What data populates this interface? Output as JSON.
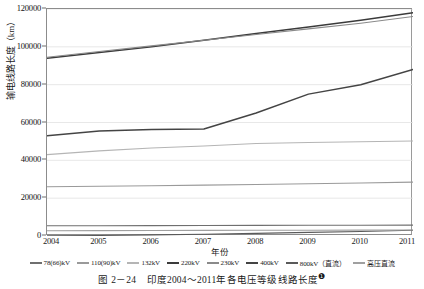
{
  "chart_data": {
    "type": "line",
    "title": "",
    "xlabel": "年份",
    "ylabel": "输电线路长度（km）",
    "x": [
      2004,
      2005,
      2006,
      2007,
      2008,
      2009,
      2010,
      2011
    ],
    "xlim": [
      2004,
      2011
    ],
    "ylim": [
      0,
      120000
    ],
    "yticks": [
      0,
      20000,
      40000,
      60000,
      80000,
      100000,
      120000
    ],
    "ytick_labels": [
      "0",
      "20000",
      "40000",
      "60000",
      "80000",
      "100000",
      "120000"
    ],
    "xtick_labels": [
      "2004",
      "2005",
      "2006",
      "2007",
      "2008",
      "2009",
      "2010",
      "2011"
    ],
    "grid": "horizontal",
    "legend_position": "bottom",
    "series": [
      {
        "name": "78(66)kV",
        "color": "#6f6f6f",
        "values": [
          5400,
          5450,
          5500,
          5550,
          5600,
          5650,
          5700,
          5750
        ]
      },
      {
        "name": "110(90)kV",
        "color": "#9a9a9a",
        "values": [
          26000,
          26300,
          26600,
          26900,
          27200,
          27600,
          28000,
          28500
        ]
      },
      {
        "name": "132kV",
        "color": "#b5b5b5",
        "values": [
          43000,
          45000,
          46500,
          47600,
          48900,
          49400,
          49800,
          50200
        ]
      },
      {
        "name": "220kV",
        "color": "#3b3b3b",
        "values": [
          94000,
          97000,
          100000,
          103500,
          107000,
          110500,
          114000,
          118000
        ]
      },
      {
        "name": "230kV",
        "color": "#8a8a8a",
        "values": [
          94500,
          97500,
          100500,
          103500,
          106500,
          109500,
          112500,
          116000
        ]
      },
      {
        "name": "400kV",
        "color": "#444444",
        "values": [
          53000,
          55500,
          56300,
          56600,
          65000,
          75000,
          80000,
          88000
        ]
      },
      {
        "name": "800kV（直流）",
        "color": "#5a5a5a",
        "values": [
          100,
          300,
          600,
          900,
          1400,
          1900,
          2400,
          3000
        ]
      },
      {
        "name": "高压直流",
        "color": "#a0a0a0",
        "values": [
          2800,
          2850,
          2900,
          2950,
          3000,
          3050,
          3100,
          3150
        ]
      }
    ]
  },
  "caption": {
    "number": "图 2－24",
    "text": "印度2004～2011年各电压等级线路长度",
    "footnote": "❶"
  }
}
